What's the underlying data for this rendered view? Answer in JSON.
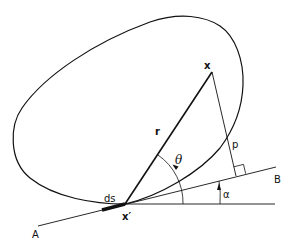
{
  "diagram": {
    "type": "geometry",
    "labels": {
      "x": "x",
      "x_prime": "x′",
      "r": "r",
      "theta": "θ",
      "p": "p",
      "ds": "ds",
      "alpha": "α",
      "A": "A",
      "B": "B"
    },
    "colors": {
      "stroke": "#111111",
      "background": "#ffffff"
    }
  }
}
